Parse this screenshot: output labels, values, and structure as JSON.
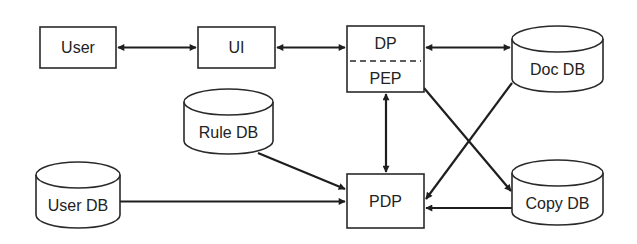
{
  "diagram": {
    "type": "architecture",
    "nodes": [
      {
        "id": "user",
        "label": "User",
        "shape": "box"
      },
      {
        "id": "ui",
        "label": "UI",
        "shape": "box"
      },
      {
        "id": "dp_pep",
        "label_top": "DP",
        "label_bottom": "PEP",
        "shape": "split-box"
      },
      {
        "id": "doc_db",
        "label": "Doc DB",
        "shape": "cylinder"
      },
      {
        "id": "rule_db",
        "label": "Rule DB",
        "shape": "cylinder"
      },
      {
        "id": "user_db",
        "label": "User DB",
        "shape": "cylinder"
      },
      {
        "id": "pdp",
        "label": "PDP",
        "shape": "box"
      },
      {
        "id": "copy_db",
        "label": "Copy DB",
        "shape": "cylinder"
      }
    ],
    "edges": [
      {
        "from": "user",
        "to": "ui",
        "direction": "both"
      },
      {
        "from": "ui",
        "to": "dp_pep",
        "direction": "both"
      },
      {
        "from": "dp_pep",
        "to": "doc_db",
        "direction": "both"
      },
      {
        "from": "dp_pep",
        "to": "pdp",
        "direction": "both"
      },
      {
        "from": "dp_pep",
        "to": "copy_db",
        "direction": "forward"
      },
      {
        "from": "doc_db",
        "to": "pdp",
        "direction": "forward"
      },
      {
        "from": "rule_db",
        "to": "pdp",
        "direction": "forward"
      },
      {
        "from": "user_db",
        "to": "pdp",
        "direction": "forward"
      },
      {
        "from": "copy_db",
        "to": "pdp",
        "direction": "forward"
      }
    ],
    "colors": {
      "stroke": "#2a2a2a",
      "fill": "#ffffff",
      "text": "#222222"
    }
  }
}
